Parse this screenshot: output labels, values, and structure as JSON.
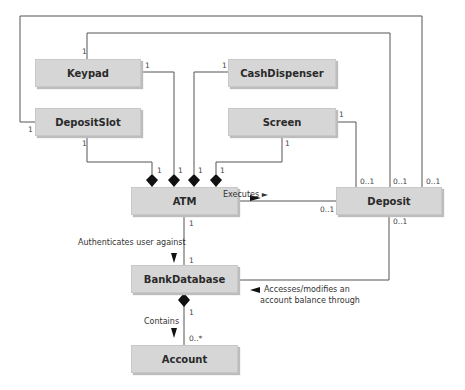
{
  "diagram": {
    "type": "UML class diagram",
    "classes": [
      {
        "id": "keypad",
        "name": "Keypad"
      },
      {
        "id": "cashdispenser",
        "name": "CashDispenser"
      },
      {
        "id": "depositslot",
        "name": "DepositSlot"
      },
      {
        "id": "screen",
        "name": "Screen"
      },
      {
        "id": "atm",
        "name": "ATM"
      },
      {
        "id": "deposit",
        "name": "Deposit"
      },
      {
        "id": "bankdatabase",
        "name": "BankDatabase"
      },
      {
        "id": "account",
        "name": "Account"
      }
    ],
    "associations": {
      "executes": {
        "label": "Executes ►",
        "atm_end": "1",
        "deposit_end": "0..1"
      },
      "authenticates": {
        "label": "Authenticates user against",
        "atm_end": "1",
        "bank_end": "1"
      },
      "contains": {
        "label": "Contains",
        "bank_end": "1",
        "account_end": "0..*"
      },
      "accesses": {
        "label_line1": "Accesses/modifies an",
        "label_line2": "account balance through",
        "deposit_end": "0..1"
      }
    },
    "multiplicities": {
      "one": "1",
      "zero_one": "0..1"
    }
  }
}
